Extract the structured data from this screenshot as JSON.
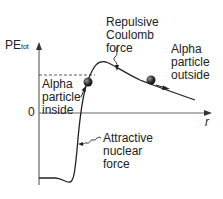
{
  "diagram": {
    "y_axis_label": "PE",
    "y_axis_subscript": "tot",
    "x_axis_label": "r",
    "origin_label": "0",
    "labels": {
      "repulsive": [
        "Repulsive",
        "Coulomb",
        "force"
      ],
      "alpha_outside": [
        "Alpha",
        "particle",
        "outside"
      ],
      "alpha_inside": [
        "Alpha",
        "particle",
        "inside"
      ],
      "attractive": [
        "Attractive",
        "nuclear",
        "force"
      ]
    },
    "colors": {
      "line": "#222222",
      "axis": "#555555",
      "particle": "#333333"
    }
  }
}
